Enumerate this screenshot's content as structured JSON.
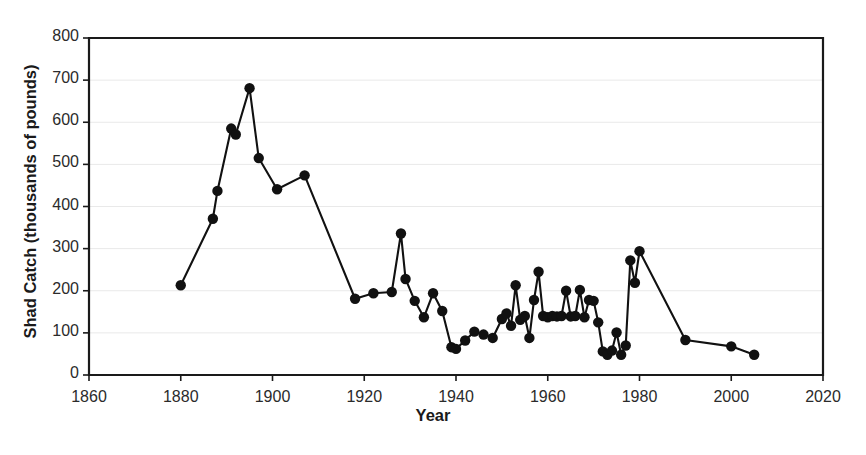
{
  "chart_data": {
    "type": "line",
    "title": "Shad Catch",
    "title_visible": false,
    "xlabel": "Year",
    "ylabel": "Shad Catch (thousands of pounds)",
    "xlim": [
      1860,
      2020
    ],
    "ylim": [
      0,
      800
    ],
    "xticks": [
      1860,
      1880,
      1900,
      1920,
      1940,
      1960,
      1980,
      2000,
      2020
    ],
    "yticks": [
      0,
      100,
      200,
      300,
      400,
      500,
      600,
      700,
      800
    ],
    "grid": "horizontal",
    "legend": "none",
    "marker": "filled-circle",
    "series_color": "#111111",
    "series": [
      {
        "name": "Shad Catch",
        "points": [
          [
            1880,
            213
          ],
          [
            1887,
            371
          ],
          [
            1888,
            437
          ],
          [
            1891,
            585
          ],
          [
            1892,
            571
          ],
          [
            1895,
            681
          ],
          [
            1897,
            515
          ],
          [
            1901,
            441
          ],
          [
            1907,
            474
          ],
          [
            1918,
            181
          ],
          [
            1922,
            194
          ],
          [
            1926,
            197
          ],
          [
            1928,
            336
          ],
          [
            1929,
            228
          ],
          [
            1931,
            176
          ],
          [
            1933,
            137
          ],
          [
            1935,
            194
          ],
          [
            1937,
            152
          ],
          [
            1939,
            66
          ],
          [
            1940,
            62
          ],
          [
            1942,
            82
          ],
          [
            1944,
            103
          ],
          [
            1946,
            96
          ],
          [
            1948,
            88
          ],
          [
            1950,
            133
          ],
          [
            1951,
            146
          ],
          [
            1952,
            117
          ],
          [
            1953,
            213
          ],
          [
            1954,
            131
          ],
          [
            1955,
            140
          ],
          [
            1956,
            88
          ],
          [
            1957,
            178
          ],
          [
            1958,
            245
          ],
          [
            1959,
            140
          ],
          [
            1960,
            137
          ],
          [
            1961,
            140
          ],
          [
            1962,
            139
          ],
          [
            1963,
            140
          ],
          [
            1964,
            200
          ],
          [
            1965,
            139
          ],
          [
            1966,
            140
          ],
          [
            1967,
            202
          ],
          [
            1968,
            137
          ],
          [
            1969,
            178
          ],
          [
            1970,
            176
          ],
          [
            1971,
            125
          ],
          [
            1972,
            56
          ],
          [
            1973,
            48
          ],
          [
            1974,
            58
          ],
          [
            1975,
            101
          ],
          [
            1976,
            48
          ],
          [
            1977,
            70
          ],
          [
            1978,
            272
          ],
          [
            1979,
            219
          ],
          [
            1980,
            294
          ],
          [
            1990,
            83
          ],
          [
            2000,
            68
          ],
          [
            2005,
            48
          ]
        ]
      }
    ]
  }
}
